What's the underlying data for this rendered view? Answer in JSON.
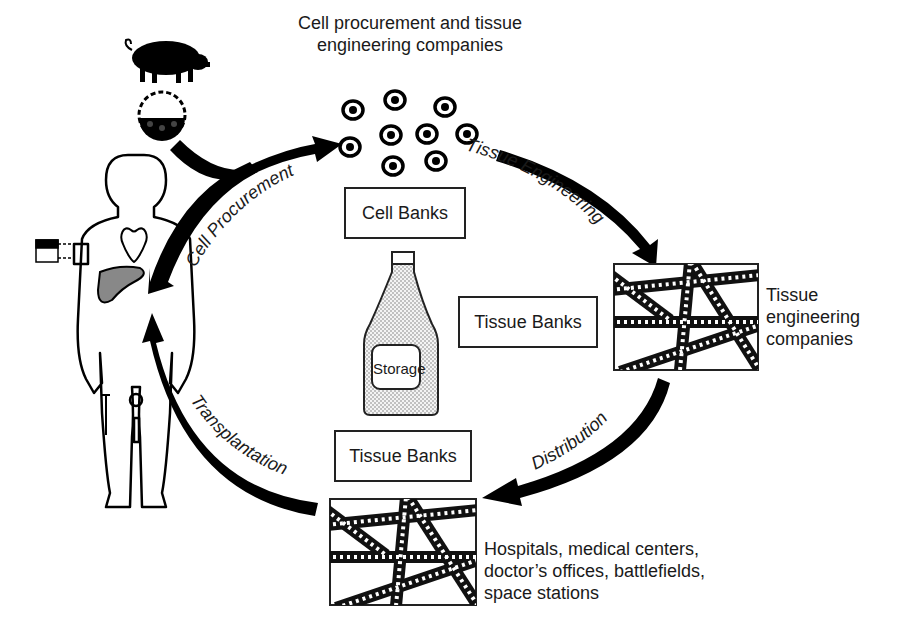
{
  "diagram": {
    "title_line1": "Cell procurement and tissue",
    "title_line2": "engineering companies",
    "boxes": {
      "cell_banks": "Cell Banks",
      "tissue_banks_right": "Tissue Banks",
      "tissue_banks_bottom": "Tissue Banks",
      "storage": "Storage"
    },
    "arrows": {
      "cell_procurement": "Cell Procurement",
      "tissue_engineering": "Tissue Engineering",
      "distribution": "Distribution",
      "transplantation": "Transplantation"
    },
    "scaffold_right_label": [
      "Tissue",
      "engineering",
      "companies"
    ],
    "scaffold_bottom_label": [
      "Hospitals, medical centers,",
      "doctor’s offices, battlefields,",
      "space stations"
    ],
    "icons": [
      "pig-icon",
      "embryo-icon",
      "cells-icon",
      "human-body-icon",
      "skin-sample-icon",
      "storage-bottle-icon",
      "scaffold-icon"
    ]
  }
}
